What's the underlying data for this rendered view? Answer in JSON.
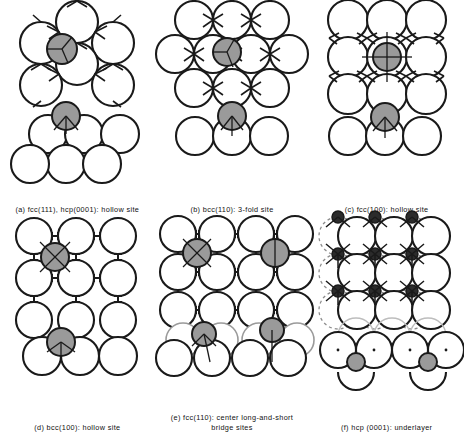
{
  "figure": {
    "background_color": "#ffffff",
    "line_color": "#1a1a1a",
    "substrate_fill": "#ffffff",
    "adsorbate_fill": "#9a9a9a",
    "subsurface_stroke": "#8d8d8d"
  },
  "panels": [
    {
      "id": "a",
      "caption": "(a) fcc(111), hcp(0001): hollow site",
      "surface": "fcc(111), hcp(0001)",
      "site": "hollow site",
      "lattice": "hexagonal close packed",
      "adsorbate_count": 1,
      "has_top_view": true,
      "has_side_view": true
    },
    {
      "id": "b",
      "caption": "(b) bcc(110): 3-fold site",
      "surface": "bcc(110)",
      "site": "3-fold site",
      "lattice": "centered rectangular",
      "adsorbate_count": 1,
      "has_top_view": true,
      "has_side_view": true
    },
    {
      "id": "c",
      "caption": "(c) fcc(100): hollow site",
      "surface": "fcc(100)",
      "site": "hollow site",
      "lattice": "square",
      "adsorbate_count": 1,
      "has_top_view": true,
      "has_side_view": true
    },
    {
      "id": "d",
      "caption": "(d) bcc(100): hollow site",
      "surface": "bcc(100)",
      "site": "hollow site",
      "lattice": "square open",
      "adsorbate_count": 1,
      "has_top_view": true,
      "has_side_view": true
    },
    {
      "id": "e",
      "caption": "(e) fcc(110): center long-and-short\nbridge sites",
      "surface": "fcc(110)",
      "site": "center long-and-short bridge sites",
      "lattice": "rectangular",
      "adsorbate_count": 2,
      "has_top_view": true,
      "has_side_view": true
    },
    {
      "id": "f",
      "caption": "(f) hcp (0001): underlayer",
      "surface": "hcp (0001)",
      "site": "underlayer",
      "lattice": "hexagonal with subsurface",
      "adsorbate_count": 9,
      "has_top_view": true,
      "has_side_view": true
    }
  ]
}
